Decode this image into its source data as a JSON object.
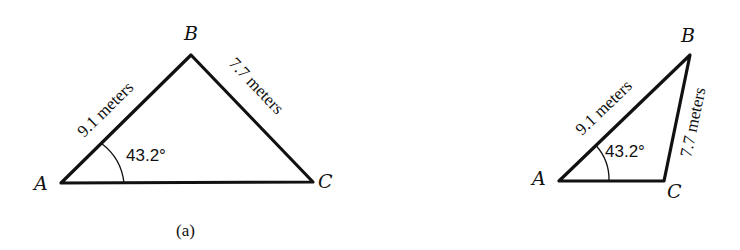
{
  "figure_a": {
    "vertices": {
      "A": "A",
      "B": "B",
      "C": "C"
    },
    "side_AB": "9.1 meters",
    "side_BC": "7.7 meters",
    "angle_A": "43.2°",
    "caption": "(a)"
  },
  "figure_b": {
    "vertices": {
      "A": "A",
      "B": "B",
      "C": "C"
    },
    "side_AB": "9.1 meters",
    "side_BC": "7.7 meters",
    "angle_A": "43.2°"
  },
  "colors": {
    "stroke": "#111111",
    "background": "#ffffff"
  }
}
